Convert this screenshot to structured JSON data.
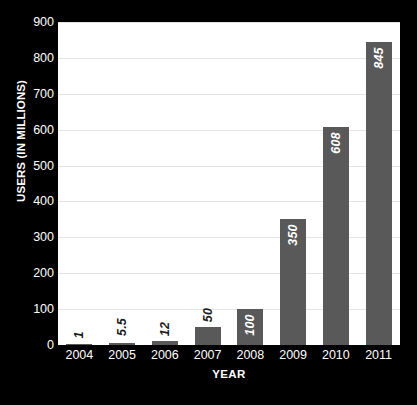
{
  "chart_data": {
    "type": "bar",
    "title": "",
    "subtitle": "",
    "xlabel": "YEAR",
    "ylabel": "USERS (IN MILLIONS)",
    "categories": [
      "2004",
      "2005",
      "2006",
      "2007",
      "2008",
      "2009",
      "2010",
      "2011"
    ],
    "values": [
      1,
      5.5,
      12,
      50,
      100,
      350,
      608,
      845
    ],
    "value_labels": [
      "1",
      "5.5",
      "12",
      "50",
      "100",
      "350",
      "608",
      "845"
    ],
    "label_placement": [
      "outside",
      "outside",
      "outside",
      "outside",
      "inside",
      "inside",
      "inside",
      "inside"
    ],
    "ylim": [
      0,
      900
    ],
    "ytick_step": 100,
    "ytick_labels": [
      "900",
      "800",
      "700",
      "600",
      "500",
      "400",
      "300",
      "200",
      "100",
      "0"
    ],
    "ytick_values": [
      900,
      800,
      700,
      600,
      500,
      400,
      300,
      200,
      100,
      0
    ],
    "grid": true,
    "grid_axis": "y",
    "legend": false,
    "legend_position": "none",
    "orientation": "vertical",
    "value_label_rotation": -90,
    "colors": {
      "figure_background": "#000000",
      "plot_background": "#ffffff",
      "bar": "#595959",
      "gridline": "#e3e3e3",
      "axis_line": "#9a9a9a",
      "axis_text": "#ffffff",
      "value_label_inside": "#ffffff",
      "value_label_outside": "#1a1a1a"
    }
  }
}
